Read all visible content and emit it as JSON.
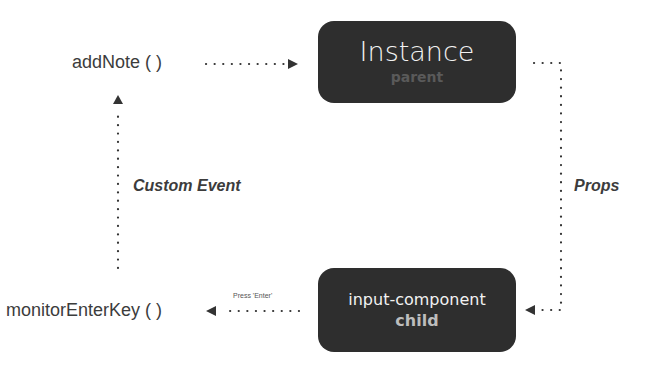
{
  "nodes": {
    "parent": {
      "title": "Instance",
      "subtitle": "parent"
    },
    "child": {
      "title": "input-component",
      "subtitle": "child"
    }
  },
  "functions": {
    "add_note": "addNote ( )",
    "monitor_enter_key": "monitorEnterKey ( )"
  },
  "edge_labels": {
    "custom_event": "Custom Event",
    "props": "Props",
    "press_enter": "Press 'Enter'"
  },
  "colors": {
    "node_fill": "#2e2e2e",
    "edge": "#333333"
  }
}
